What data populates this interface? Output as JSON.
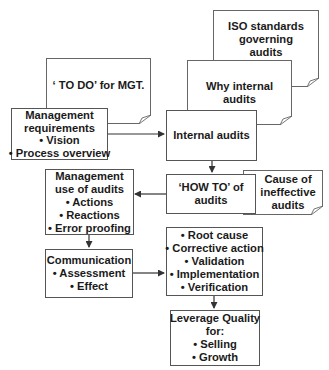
{
  "diagram": {
    "nodes": {
      "iso_standards": {
        "kind": "document",
        "lines": [
          "ISO standards",
          "governing",
          "audits"
        ]
      },
      "why_internal_audits": {
        "kind": "document",
        "lines": [
          "Why internal",
          "audits"
        ]
      },
      "todo_for_mgt": {
        "kind": "document",
        "lines": [
          "‘ TO DO’ for MGT."
        ]
      },
      "management_requirements": {
        "kind": "process",
        "lines": [
          "Management",
          "requirements",
          "• Vision",
          "• Process overview"
        ]
      },
      "internal_audits": {
        "kind": "process",
        "lines": [
          "Internal audits"
        ]
      },
      "how_to_audits": {
        "kind": "process",
        "lines": [
          "‘HOW TO’ of",
          "audits"
        ]
      },
      "cause_ineffective_audits": {
        "kind": "document",
        "lines": [
          "Cause of",
          "ineffective",
          "audits"
        ]
      },
      "management_use_audits": {
        "kind": "process",
        "lines": [
          "Management",
          "use of audits",
          "• Actions",
          "• Reactions",
          "• Error proofing"
        ]
      },
      "communication": {
        "kind": "process",
        "lines": [
          "Communication",
          "• Assessment",
          "• Effect"
        ]
      },
      "root_cause": {
        "kind": "process",
        "lines": [
          "• Root cause",
          "• Corrective action",
          "• Validation",
          "• Implementation",
          "• Verification"
        ]
      },
      "leverage_quality": {
        "kind": "process",
        "lines": [
          "Leverage Quality",
          "for:",
          "• Selling",
          "• Growth"
        ]
      }
    },
    "edges": [
      {
        "from": "management_requirements",
        "to": "internal_audits"
      },
      {
        "from": "internal_audits",
        "to": "how_to_audits"
      },
      {
        "from": "how_to_audits",
        "to": "management_use_audits"
      },
      {
        "from": "management_use_audits",
        "to": "communication"
      },
      {
        "from": "communication",
        "to": "root_cause"
      },
      {
        "from": "root_cause",
        "to": "leverage_quality"
      }
    ],
    "colors": {
      "stroke": "#555555",
      "text": "#1a1a1a",
      "background": "#ffffff"
    }
  }
}
